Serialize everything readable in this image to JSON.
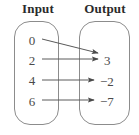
{
  "diagram": {
    "type": "mapping-diagram",
    "headers": {
      "input": "Input",
      "output": "Output"
    },
    "input_values": [
      {
        "label": "0",
        "x": 32,
        "y": 34
      },
      {
        "label": "2",
        "x": 32,
        "y": 54
      },
      {
        "label": "4",
        "x": 32,
        "y": 74
      },
      {
        "label": "6",
        "x": 32,
        "y": 95
      }
    ],
    "output_values": [
      {
        "label": "3",
        "x": 104,
        "y": 54
      },
      {
        "label": "−2",
        "x": 100,
        "y": 75
      },
      {
        "label": "−7",
        "x": 100,
        "y": 95
      }
    ],
    "mappings": [
      {
        "from": "0",
        "to": "3",
        "x1": 42,
        "y1": 39,
        "x2": 98,
        "y2": 53
      },
      {
        "from": "2",
        "to": "3",
        "x1": 42,
        "y1": 59,
        "x2": 98,
        "y2": 59
      },
      {
        "from": "4",
        "to": "−2",
        "x1": 42,
        "y1": 80,
        "x2": 94,
        "y2": 80
      },
      {
        "from": "6",
        "to": "−7",
        "x1": 42,
        "y1": 100,
        "x2": 94,
        "y2": 100
      }
    ],
    "colors": {
      "background": "#ffffff",
      "header_text": "#2b2b2b",
      "value_text": "#4a4a4a",
      "oval_stroke": "#8c8c8c",
      "arrow_stroke": "#5a5a5a"
    }
  }
}
